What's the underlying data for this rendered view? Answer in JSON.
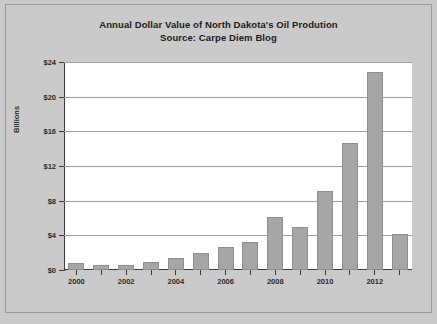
{
  "figure": {
    "background_color": "#cacaca",
    "plot_background_color": "#ffffff",
    "border_color": "#9a9a9a",
    "axis_color": "#3a3a3a",
    "gridline_color": "#9e9e9e",
    "bar_color": "#a6a6a6"
  },
  "title": {
    "line1": "Annual Dollar Value of North Dakota's Oil Prodution",
    "line2": "Source: Carpe Diem Blog"
  },
  "axes": {
    "ylabel": "Billions",
    "ytick_labels": [
      "$0",
      "$4",
      "$8",
      "$12",
      "$16",
      "$20",
      "$24"
    ],
    "xtick_labels": [
      "2000",
      "",
      "2002",
      "",
      "2004",
      "",
      "2006",
      "",
      "2008",
      "",
      "2010",
      "",
      "2012",
      ""
    ]
  },
  "chart_data": {
    "type": "bar",
    "title": "Annual Dollar Value of North Dakota's Oil Prodution\nSource: Carpe Diem Blog",
    "subtitle": "Source: Carpe Diem Blog",
    "xlabel": "",
    "ylabel": "Billions",
    "ylim": [
      0,
      24
    ],
    "ytick_values": [
      0,
      4,
      8,
      12,
      16,
      20,
      24
    ],
    "ytick_labels": [
      "$0",
      "$4",
      "$8",
      "$12",
      "$16",
      "$20",
      "$24"
    ],
    "grid": true,
    "grid_axis": "y",
    "legend": false,
    "units": "Billions of US dollars",
    "categories": [
      "2000",
      "2001",
      "2002",
      "2003",
      "2004",
      "2005",
      "2006",
      "2007",
      "2008",
      "2009",
      "2010",
      "2011",
      "2012",
      "2013"
    ],
    "values": [
      0.8,
      0.6,
      0.6,
      0.9,
      1.4,
      2.0,
      2.6,
      3.2,
      6.1,
      5.0,
      9.1,
      14.6,
      22.9,
      4.2
    ],
    "labeled_categories": [
      "2000",
      "2002",
      "2004",
      "2006",
      "2008",
      "2010",
      "2012"
    ],
    "bar_color": "#a6a6a6"
  }
}
